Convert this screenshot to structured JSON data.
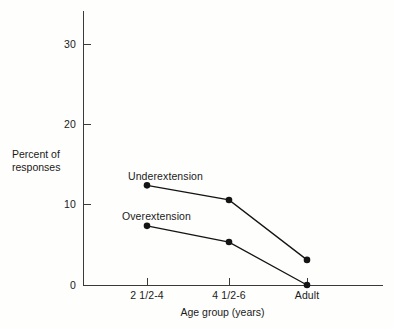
{
  "chart_data": {
    "type": "line",
    "title": "",
    "xlabel": "Age group (years)",
    "ylabel": "Percent of responses",
    "categories": [
      "2 1/2-4",
      "4 1/2-6",
      "Adult"
    ],
    "x_tick_labels": [
      "2 1/2-4",
      "4 1/2-6",
      "Adult"
    ],
    "y_tick_labels": [
      "0",
      "10",
      "20",
      "30"
    ],
    "y_ticks": [
      0,
      10,
      20,
      30
    ],
    "ylim": [
      0,
      34
    ],
    "grid": false,
    "legend_position": "inline-labels",
    "series": [
      {
        "name": "Underextension",
        "values": [
          12.3,
          10.5,
          3.1
        ]
      },
      {
        "name": "Overextension",
        "values": [
          7.3,
          5.3,
          0.0
        ]
      }
    ]
  },
  "axes": {
    "y_title_line1": "Percent of",
    "y_title_line2": "responses",
    "x_title": "Age group (years)"
  },
  "ticks": {
    "y": [
      {
        "label": "30",
        "value": 30
      },
      {
        "label": "20",
        "value": 20
      },
      {
        "label": "10",
        "value": 10
      },
      {
        "label": "0",
        "value": 0
      }
    ],
    "x": [
      {
        "label": "2 1/2-4"
      },
      {
        "label": "4 1/2-6"
      },
      {
        "label": "Adult"
      }
    ]
  },
  "series_labels": {
    "underextension": "Underextension",
    "overextension": "Overextension"
  },
  "colors": {
    "line": "#141414",
    "axis": "#3a3a3a",
    "text": "#1a1a1a",
    "background": "#fefefd"
  }
}
